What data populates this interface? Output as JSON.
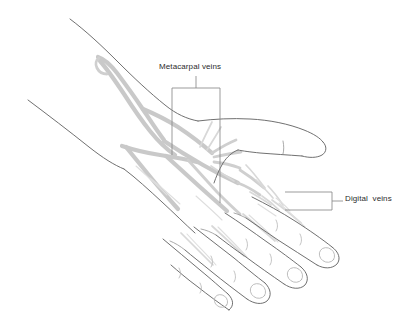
{
  "figure": {
    "background_color": "#ffffff",
    "outline_color": "#606060",
    "vein_color": "#c9c9c9",
    "label_color": "#2b2b2b",
    "callout_color": "#8a8a8a",
    "width": 415,
    "height": 311
  },
  "labels": [
    {
      "id": "metacarpal",
      "text": "Metacarpal veins",
      "callout_style": "bracket",
      "text_x": 159,
      "text_y": 62,
      "bracket": {
        "top_y": 88,
        "left_x": 172,
        "right_x": 220,
        "left_leg_bottom_y": 155,
        "right_leg_bottom_y": 203,
        "stem_x": 196,
        "stem_top_y": 76
      }
    },
    {
      "id": "digital",
      "text": "Digital  veins",
      "callout_style": "box",
      "text_x": 345,
      "text_y": 194,
      "box": {
        "left_x": 285,
        "right_x": 332,
        "top_y": 192,
        "bottom_y": 210
      },
      "leader": {
        "from_x": 332,
        "to_x": 343,
        "y": 201
      }
    }
  ],
  "anatomy": {
    "regions": [
      "forearm",
      "wrist",
      "dorsum of hand",
      "thumb",
      "index finger",
      "middle finger",
      "ring finger",
      "little finger"
    ],
    "vein_groups": [
      "cephalic vein",
      "dorsal venous network",
      "dorsal metacarpal veins",
      "dorsal digital veins"
    ]
  }
}
